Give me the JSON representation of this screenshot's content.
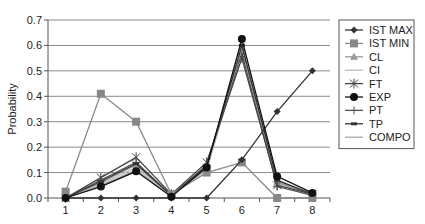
{
  "chart_data": {
    "type": "line",
    "title": "",
    "xlabel": "",
    "ylabel": "Probability",
    "ylim": [
      0,
      0.7
    ],
    "yticks": [
      "0.0",
      "0.1",
      "0.2",
      "0.3",
      "0.4",
      "0.5",
      "0.6",
      "0.7"
    ],
    "categories": [
      "1",
      "2",
      "3",
      "4",
      "5",
      "6",
      "7",
      "8"
    ],
    "grid": true,
    "legend_position": "right",
    "series": [
      {
        "name": "IST MAX",
        "marker": "diamond",
        "color": "#333333",
        "values": [
          0.0,
          0.0,
          0.0,
          0.0,
          0.0,
          0.15,
          0.34,
          0.5
        ]
      },
      {
        "name": "IST MIN",
        "marker": "square",
        "color": "#888888",
        "values": [
          0.025,
          0.41,
          0.3,
          0.015,
          0.1,
          0.14,
          0.0,
          0.0
        ]
      },
      {
        "name": "CL",
        "marker": "triangle",
        "color": "#999999",
        "values": [
          0.0,
          0.06,
          0.13,
          0.01,
          0.12,
          0.59,
          0.06,
          0.015
        ]
      },
      {
        "name": "CI",
        "marker": "none",
        "color": "#bbbbbb",
        "values": [
          0.0,
          0.055,
          0.12,
          0.01,
          0.11,
          0.58,
          0.055,
          0.015
        ]
      },
      {
        "name": "FT",
        "marker": "star",
        "color": "#444444",
        "values": [
          0.0,
          0.08,
          0.16,
          0.015,
          0.14,
          0.55,
          0.05,
          0.015
        ]
      },
      {
        "name": "EXP",
        "marker": "circle",
        "color": "#111111",
        "values": [
          0.0,
          0.045,
          0.105,
          0.005,
          0.12,
          0.625,
          0.085,
          0.02
        ]
      },
      {
        "name": "PT",
        "marker": "plus",
        "color": "#555555",
        "values": [
          0.0,
          0.07,
          0.14,
          0.01,
          0.13,
          0.57,
          0.045,
          0.01
        ]
      },
      {
        "name": "TP",
        "marker": "dash",
        "color": "#333333",
        "values": [
          0.0,
          0.065,
          0.135,
          0.01,
          0.125,
          0.6,
          0.07,
          0.015
        ]
      },
      {
        "name": "COMPO",
        "marker": "none",
        "color": "#aaaaaa",
        "values": [
          0.0,
          0.05,
          0.11,
          0.01,
          0.115,
          0.585,
          0.065,
          0.015
        ]
      }
    ]
  }
}
